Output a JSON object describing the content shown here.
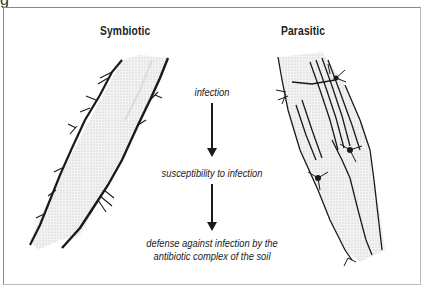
{
  "figure": {
    "top_fragment": "g",
    "panels": {
      "left": {
        "title": "Symbiotic",
        "illustration": "root-with-symbiotic-hyphae"
      },
      "right": {
        "title": "Parasitic",
        "illustration": "root-with-parasitic-hyphae-penetrating"
      }
    },
    "flow": {
      "steps": [
        "infection",
        "susceptibility to infection",
        "defense against infection by the",
        "antibiotic complex of the soil"
      ],
      "arrow_icon": "down-arrow"
    },
    "colors": {
      "ink": "#1a1a1a",
      "root_fill": "#ececec",
      "frame": "#888888"
    }
  }
}
